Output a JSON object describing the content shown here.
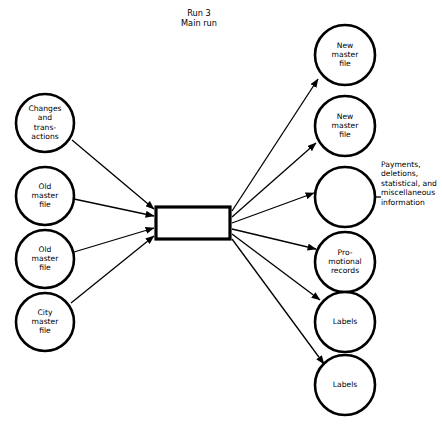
{
  "diagram": {
    "title_lines": [
      "Run 3",
      "Main  run"
    ],
    "title_x": 199,
    "title_y": 16,
    "process": {
      "name": "main-run-process",
      "label": "",
      "x": 156,
      "y": 207,
      "width": 74,
      "height": 32
    },
    "inputs": [
      {
        "id": "changes-and-transactions",
        "lines": [
          "Changes",
          "and",
          "trans-",
          "actions"
        ],
        "cx": 45,
        "cy": 123,
        "r": 29
      },
      {
        "id": "old-master-file-1",
        "lines": [
          "Old",
          "master",
          "file"
        ],
        "cx": 45,
        "cy": 196,
        "r": 29
      },
      {
        "id": "old-master-file-2",
        "lines": [
          "Old",
          "master",
          "file"
        ],
        "cx": 45,
        "cy": 259,
        "r": 29
      },
      {
        "id": "city-master-file",
        "lines": [
          "City",
          "master",
          "file"
        ],
        "cx": 45,
        "cy": 322,
        "r": 29
      }
    ],
    "outputs": [
      {
        "id": "new-master-file-1",
        "lines": [
          "New",
          "master",
          "file"
        ],
        "cx": 345,
        "cy": 55,
        "r": 30
      },
      {
        "id": "new-master-file-2",
        "lines": [
          "New",
          "master",
          "file"
        ],
        "cx": 345,
        "cy": 126,
        "r": 30
      },
      {
        "id": "payments-deletions-circle",
        "lines": [],
        "cx": 345,
        "cy": 197,
        "r": 30
      },
      {
        "id": "promotional-records",
        "lines": [
          "Pro-",
          "motional",
          "records"
        ],
        "cx": 345,
        "cy": 262,
        "r": 30
      },
      {
        "id": "labels-1",
        "lines": [
          "Labels"
        ],
        "cx": 345,
        "cy": 322,
        "r": 30
      },
      {
        "id": "labels-2",
        "lines": [
          "Labels"
        ],
        "cx": 345,
        "cy": 385,
        "r": 30
      }
    ],
    "annotation": {
      "id": "payments-annotation",
      "lines": [
        "Payments,",
        "deletions,",
        "statistical, and",
        "miscellaneous",
        "information"
      ],
      "x": 381,
      "y": 167,
      "arrow_from_x": 381,
      "arrow_from_y": 197,
      "arrow_to_x": 350,
      "arrow_to_y": 197
    },
    "input_edges": [
      {
        "id": "edge-changes-to-process",
        "x1": 72,
        "y1": 140,
        "x2": 154,
        "y2": 209
      },
      {
        "id": "edge-old-master-1-to-process",
        "x1": 74,
        "y1": 199,
        "x2": 154,
        "y2": 216
      },
      {
        "id": "edge-old-master-2-to-process",
        "x1": 74,
        "y1": 252,
        "x2": 154,
        "y2": 228
      },
      {
        "id": "edge-city-master-to-process",
        "x1": 71,
        "y1": 303,
        "x2": 154,
        "y2": 236
      }
    ],
    "output_edges": [
      {
        "id": "edge-process-to-new-master-1",
        "x1": 232,
        "y1": 211,
        "x2": 318,
        "y2": 79
      },
      {
        "id": "edge-process-to-new-master-2",
        "x1": 232,
        "y1": 217,
        "x2": 316,
        "y2": 143
      },
      {
        "id": "edge-process-to-payments",
        "x1": 232,
        "y1": 223,
        "x2": 314,
        "y2": 193
      },
      {
        "id": "edge-process-to-promotional",
        "x1": 232,
        "y1": 229,
        "x2": 316,
        "y2": 249
      },
      {
        "id": "edge-process-to-labels-1",
        "x1": 232,
        "y1": 234,
        "x2": 320,
        "y2": 300
      },
      {
        "id": "edge-process-to-labels-2",
        "x1": 232,
        "y1": 239,
        "x2": 324,
        "y2": 364
      }
    ],
    "colors": {
      "stroke": "#000000",
      "fill": "#ffffff"
    }
  }
}
